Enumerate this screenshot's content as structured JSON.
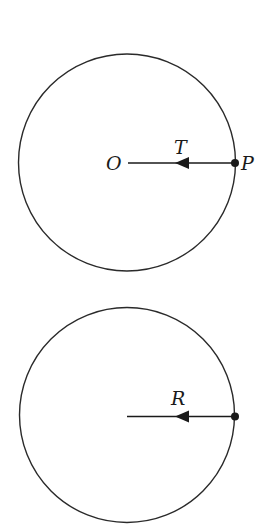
{
  "figures": [
    {
      "id": "top",
      "circle": {
        "cx": 127,
        "cy": 162.5,
        "r": 108.5
      },
      "vector": {
        "x1": 235,
        "y1": 163,
        "x2": 128,
        "y2": 163,
        "arrow_tip_x": 175,
        "arrow_base_x": 189
      },
      "point": {
        "cx": 235,
        "cy": 163,
        "r": 4
      },
      "labels": {
        "center": "O",
        "force": "T",
        "point": "P"
      }
    },
    {
      "id": "bottom",
      "circle": {
        "cx": 127,
        "cy": 415,
        "r": 107.5
      },
      "vector": {
        "x1": 235,
        "y1": 416.5,
        "x2": 127,
        "y2": 416.5,
        "arrow_tip_x": 175,
        "arrow_base_x": 189
      },
      "point": {
        "cx": 235,
        "cy": 416.5,
        "r": 4
      },
      "labels": {
        "force": "R"
      }
    }
  ],
  "colors": {
    "stroke": "#2a2a2a",
    "background": "#ffffff"
  }
}
